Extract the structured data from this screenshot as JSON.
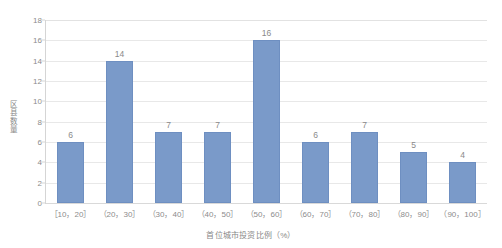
{
  "chart_data": {
    "type": "bar",
    "title": "",
    "subtitle": "",
    "xlabel": "首位城市投资比例（%）",
    "ylabel": "区县数量",
    "categories": [
      "［10，20］",
      "（20，30］",
      "（30，40］",
      "（40，50］",
      "（50，60］",
      "（60，70］",
      "（70，80］",
      "（80，90］",
      "（90，100］"
    ],
    "values": [
      6,
      14,
      7,
      7,
      16,
      6,
      7,
      5,
      4
    ],
    "data_labels": [
      "6",
      "14",
      "7",
      "7",
      "16",
      "6",
      "7",
      "5",
      "4"
    ],
    "ylim": [
      0,
      18
    ],
    "ytick_step": 2,
    "ytick_labels": [
      "0",
      "2",
      "4",
      "6",
      "8",
      "10",
      "12",
      "14",
      "16",
      "18"
    ],
    "grid": true,
    "grid_axis": "y",
    "legend": false,
    "legend_position": "none",
    "series": [
      {
        "name": "区县数量",
        "values": [
          6,
          14,
          7,
          7,
          16,
          6,
          7,
          5,
          4
        ],
        "color": "#7a9ac9"
      }
    ]
  },
  "colors": {
    "bar_fill": "#7a9ac9",
    "bar_stroke": "#6e8fc1",
    "gridline": "#e8e8e8",
    "axis_line": "#d5d5d5",
    "tick_text": "#8c8c8c",
    "title_text": "#888888",
    "background": "#ffffff"
  }
}
